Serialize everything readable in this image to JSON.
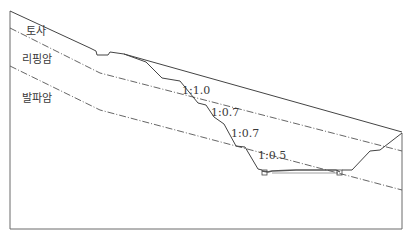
{
  "diagram": {
    "type": "cross-section",
    "layers": [
      {
        "id": "soil",
        "label": "토사"
      },
      {
        "id": "rippable-rock",
        "label": "리핑암"
      },
      {
        "id": "blasting-rock",
        "label": "발파암"
      }
    ],
    "slopes": [
      {
        "label": "1:1.0"
      },
      {
        "label": "1:0.7"
      },
      {
        "label": "1:0.7"
      },
      {
        "label": "1:0.5"
      }
    ],
    "colors": {
      "line": "#555555",
      "background": "#ffffff"
    }
  }
}
